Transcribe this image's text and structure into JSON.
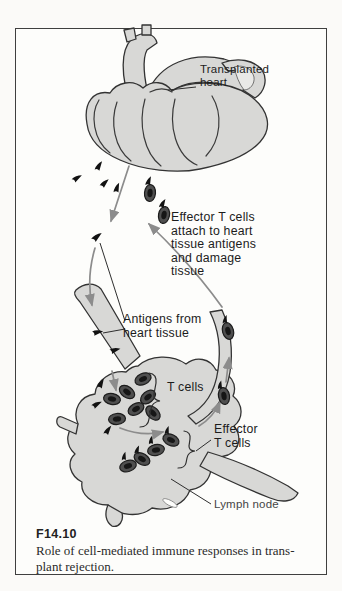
{
  "figure": {
    "caption_id": "F14.10",
    "caption_text": "Role of cell-mediated immune responses in trans-\nplant rejection."
  },
  "labels": {
    "transplanted_heart": "Transplanted\nheart",
    "effector_attach": "Effector T cells\nattach to heart\ntissue antigens\nand damage\ntissue",
    "antigens_from_heart": "Antigens from\nheart tissue",
    "t_cells": "T cells",
    "effector_t_cells": "Effector\nT cells",
    "lymph_node": "Lymph node"
  },
  "colors": {
    "organ_fill": "#d8d8d6",
    "outline": "#333333",
    "arrow_gray": "#8c8c8c",
    "antigen_black": "#121212",
    "cell_body": "#4f4f4f",
    "cell_nucleus": "#161616",
    "frame_border": "#3f3f3f",
    "background": "#fbfaf8"
  },
  "glyphs": {
    "antigen": "small black flag-shaped particle",
    "t_cell": "dark oval cell with darker nucleus",
    "effector_t_cell": "dark oval cell with antigen flag attached"
  }
}
